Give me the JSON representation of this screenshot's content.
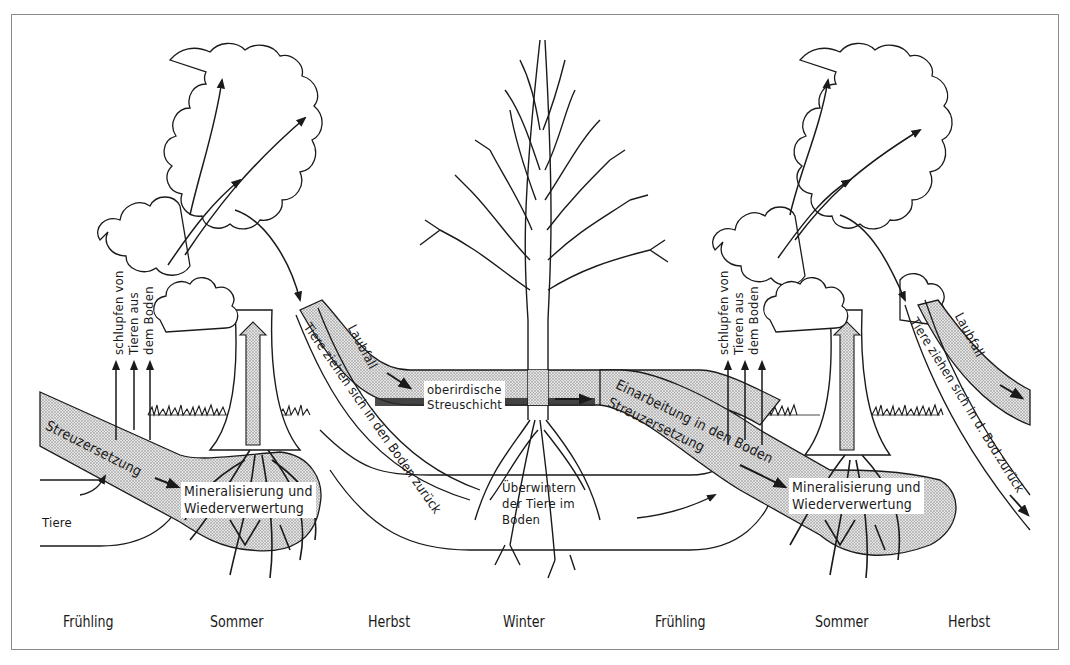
{
  "diagram": {
    "title": "",
    "seasons": [
      "Frühling",
      "Sommer",
      "Herbst",
      "Winter",
      "Frühling",
      "Sommer",
      "Herbst"
    ],
    "labels": {
      "emerge_left": [
        "schlupfen von",
        "Tieren aus",
        "dem Boden"
      ],
      "emerge_right": [
        "schlupfen von",
        "Tieren aus",
        "dem Boden"
      ],
      "decomposition_left": "Streuzersetzung",
      "animals": "Tiere",
      "mineralization_left": [
        "Mineralisierung und",
        "Wiederverwertung"
      ],
      "leaf_fall_left": "Laubfall",
      "animals_retreat_left": "Tiere ziehen sich in den Boden zurück",
      "surface_litter": [
        "oberirdische",
        "Streuschicht"
      ],
      "overwintering": [
        "Überwintern",
        "der Tiere im",
        "Boden"
      ],
      "incorporation": "Einarbeitung in den Boden",
      "decomposition_right": "Streuzersetzung",
      "mineralization_right": [
        "Mineralisierung und",
        "Wiederverwertung"
      ],
      "leaf_fall_right": "Laubfall",
      "animals_retreat_right": "Tiere ziehen sich in d. Bod.zurück"
    },
    "colors": {
      "ink": "#1a1a1a",
      "stipple": "#c8c8c8",
      "frame": "#8a8a8a"
    }
  }
}
